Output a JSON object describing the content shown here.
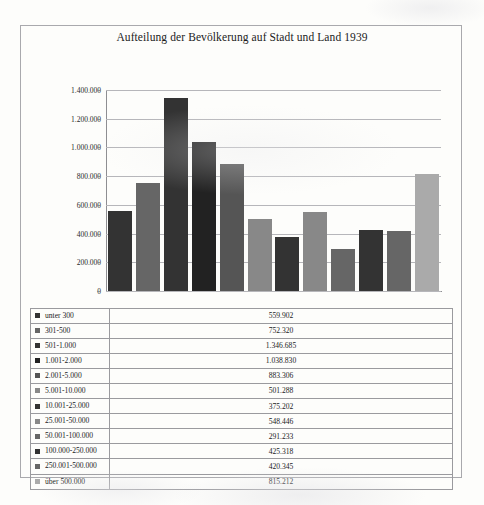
{
  "page": {
    "background_color": "#fdfdfb"
  },
  "chart": {
    "title": "Aufteilung der Bevölkerung auf Stadt und Land 1939",
    "colors": {
      "dark": "#333333",
      "medium": "#666666",
      "light": "#aaaaaa",
      "gridline": "#b6b6ba",
      "axis": "#8e8e92",
      "border": "#a9a9ad"
    }
  },
  "chart_data": {
    "type": "bar",
    "title": "Aufteilung der Bevölkerung auf Stadt und Land 1939",
    "xlabel": "",
    "ylabel": "",
    "ylim": [
      0,
      1400000
    ],
    "grid": true,
    "legend_position": "table-below",
    "ytick_labels": [
      "0",
      "200.000",
      "400.000",
      "600.000",
      "800.000",
      "1.000.000",
      "1.200.000",
      "1.400.000"
    ],
    "ytick_values": [
      0,
      200000,
      400000,
      600000,
      800000,
      1000000,
      1200000,
      1400000
    ],
    "categories": [
      "unter 300",
      "301-500",
      "501-1.000",
      "1.001-2.000",
      "2.001-5.000",
      "5.001-10.000",
      "10.001-25.000",
      "25.001-50.000",
      "50.001-100.000",
      "100.000-250.000",
      "250.001-500.000",
      "über 500.000"
    ],
    "values": [
      559902,
      752320,
      1346685,
      1038830,
      883306,
      501288,
      375202,
      548446,
      291233,
      425318,
      420345,
      815212
    ],
    "value_labels": [
      "559.902",
      "752.320",
      "1.346.685",
      "1.038.830",
      "883.306",
      "501.288",
      "375.202",
      "548.446",
      "291.233",
      "425.318",
      "420.345",
      "815.212"
    ],
    "bar_colors": [
      "#333333",
      "#666666",
      "#333333",
      "#222222",
      "#555555",
      "#888888",
      "#333333",
      "#888888",
      "#666666",
      "#333333",
      "#666666",
      "#aaaaaa"
    ],
    "swatch_colors": [
      "#333333",
      "#666666",
      "#333333",
      "#222222",
      "#555555",
      "#888888",
      "#333333",
      "#888888",
      "#666666",
      "#333333",
      "#666666",
      "#aaaaaa"
    ]
  }
}
